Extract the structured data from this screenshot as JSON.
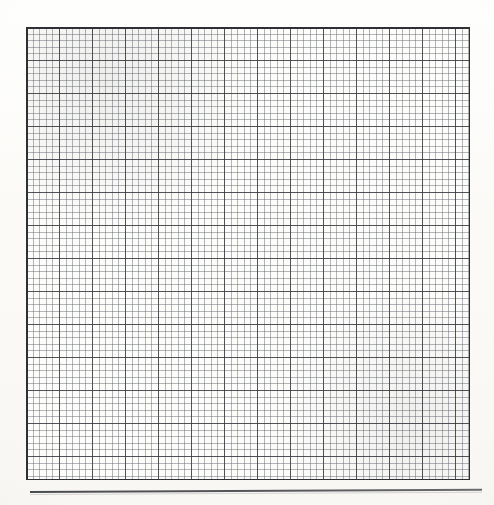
{
  "document": {
    "kind": "graph-paper-scan",
    "title": "",
    "background_color": "#fdfdfb",
    "page_width": 494,
    "page_height": 505
  },
  "grid": {
    "label": "",
    "left": 26,
    "top": 27,
    "width": 444,
    "height": 453,
    "major_columns": 13,
    "major_rows": 13,
    "major_spacing_px": 33.0,
    "minor_per_major": 5,
    "minor_spacing_px": 6.6,
    "major_line_color": "#3a3a3e",
    "minor_line_color": "#5f6268",
    "border_color": "#2f3033",
    "cell_fill_color": "#fcfcfa"
  },
  "footer": {
    "rule_label": "",
    "rule_color": "#55565b",
    "rule_left": 30,
    "rule_top": 491,
    "rule_width": 452,
    "rule_height": 2
  }
}
